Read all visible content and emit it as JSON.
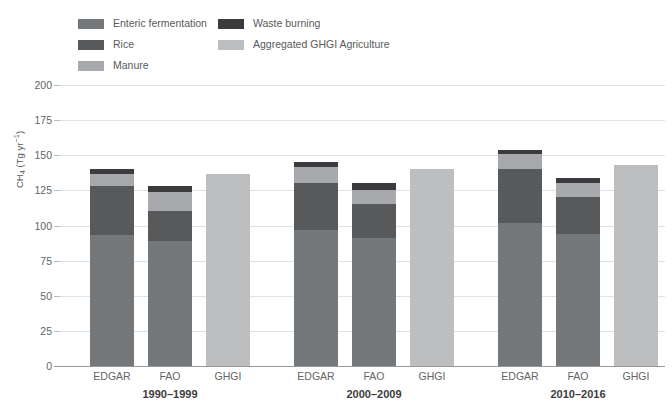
{
  "chart_data": {
    "type": "bar",
    "stacked": true,
    "title": "",
    "xlabel": "",
    "ylabel": "CH4 (Tg yr-1)",
    "ylabel_rich": {
      "base": "CH",
      "sub": "4",
      "unit_open": " (Tg yr",
      "sup": "-1",
      "unit_close": ")"
    },
    "ylim": [
      0,
      200
    ],
    "yticks": [
      0,
      25,
      50,
      75,
      100,
      125,
      150,
      175,
      200
    ],
    "ytick_labels": [
      "0",
      "25",
      "50",
      "75",
      "100",
      "125",
      "150",
      "175",
      "200"
    ],
    "grid": true,
    "legend_position": "top-left",
    "categories": [
      "EDGAR",
      "FAO",
      "GHGI",
      "EDGAR",
      "FAO",
      "GHGI",
      "EDGAR",
      "FAO",
      "GHGI"
    ],
    "groups": [
      {
        "label": "1990–1999",
        "members": [
          "EDGAR",
          "FAO",
          "GHGI"
        ]
      },
      {
        "label": "2000–2009",
        "members": [
          "EDGAR",
          "FAO",
          "GHGI"
        ]
      },
      {
        "label": "2010–2016",
        "members": [
          "EDGAR",
          "FAO",
          "GHGI"
        ]
      }
    ],
    "series": [
      {
        "name": "Enteric fermentation",
        "color": "#75787b",
        "values": [
          93,
          89,
          0,
          97,
          91,
          0,
          102,
          94,
          0
        ]
      },
      {
        "name": "Rice",
        "color": "#58595b",
        "values": [
          35,
          21,
          0,
          33,
          24,
          0,
          38,
          26,
          0
        ]
      },
      {
        "name": "Manure",
        "color": "#a7a9ac",
        "values": [
          9,
          14,
          0,
          12,
          10,
          0,
          11,
          10,
          0
        ]
      },
      {
        "name": "Waste burning",
        "color": "#3b3b3d",
        "values": [
          3,
          4,
          0,
          3,
          5,
          0,
          3,
          4,
          0
        ]
      },
      {
        "name": "Aggregated GHGI Agriculture",
        "color": "#bcbec0",
        "values": [
          0,
          0,
          137,
          0,
          0,
          140,
          0,
          0,
          143
        ]
      }
    ],
    "bar_totals": [
      140,
      128,
      137,
      145,
      130,
      140,
      154,
      134,
      143
    ],
    "annotations": []
  },
  "legend": {
    "columns": [
      {
        "items": [
          {
            "label": "Enteric fermentation",
            "color": "#75787b"
          },
          {
            "label": "Rice",
            "color": "#58595b"
          },
          {
            "label": "Manure",
            "color": "#a7a9ac"
          }
        ]
      },
      {
        "items": [
          {
            "label": "Waste burning",
            "color": "#3b3b3d"
          },
          {
            "label": "Aggregated GHGI Agriculture",
            "color": "#bcbec0"
          }
        ]
      }
    ]
  },
  "colors": {
    "background": "#ffffff",
    "grid": "#dfe3e6",
    "axis": "#9a9a9a",
    "text": "#636466",
    "group_text": "#3c3c3e"
  }
}
